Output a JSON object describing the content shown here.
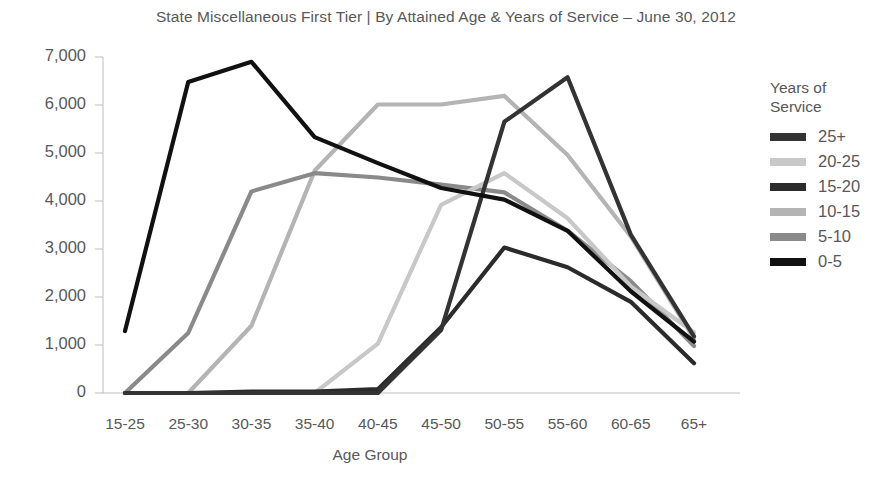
{
  "chart_data": {
    "type": "line",
    "title": "State Miscellaneous First Tier | By Attained Age & Years of Service – June 30, 2012",
    "xlabel": "Age Group",
    "ylabel": "",
    "legend_title": "Years of\nService",
    "legend_position": "right",
    "grid": false,
    "categories": [
      "15-25",
      "25-30",
      "30-35",
      "35-40",
      "40-45",
      "45-50",
      "50-55",
      "55-60",
      "60-65",
      "65+"
    ],
    "ylim": [
      0,
      7000
    ],
    "yticks": [
      0,
      1000,
      2000,
      3000,
      4000,
      5000,
      6000,
      7000
    ],
    "ytick_labels": [
      "0",
      "1,000",
      "2,000",
      "3,000",
      "4,000",
      "5,000",
      "6,000",
      "7,000"
    ],
    "series": [
      {
        "name": "25+",
        "color": "#333333",
        "values": [
          0,
          0,
          0,
          0,
          0,
          1310,
          5650,
          6580,
          3300,
          1180
        ]
      },
      {
        "name": "20-25",
        "color": "#c8c8c8",
        "values": [
          0,
          0,
          0,
          0,
          1030,
          3920,
          4580,
          3640,
          2220,
          1260
        ]
      },
      {
        "name": "15-20",
        "color": "#2b2b2b",
        "values": [
          0,
          0,
          30,
          30,
          80,
          1370,
          3030,
          2620,
          1900,
          620
        ]
      },
      {
        "name": "10-15",
        "color": "#b4b4b4",
        "values": [
          0,
          0,
          1400,
          4630,
          6010,
          6010,
          6190,
          4960,
          3260,
          1130
        ]
      },
      {
        "name": "5-10",
        "color": "#8a8a8a",
        "values": [
          0,
          1250,
          4200,
          4580,
          4490,
          4340,
          4180,
          3380,
          2330,
          980
        ]
      },
      {
        "name": "0-5",
        "color": "#111111",
        "values": [
          1290,
          6480,
          6900,
          5330,
          4790,
          4270,
          4030,
          3380,
          2120,
          1070
        ]
      }
    ]
  },
  "legend": {
    "title": "Years of\nService",
    "items": [
      {
        "label": "25+",
        "color": "#333333"
      },
      {
        "label": "20-25",
        "color": "#c8c8c8"
      },
      {
        "label": "15-20",
        "color": "#2b2b2b"
      },
      {
        "label": "10-15",
        "color": "#b4b4b4"
      },
      {
        "label": "5-10",
        "color": "#8a8a8a"
      },
      {
        "label": "0-5",
        "color": "#111111"
      }
    ]
  },
  "axes": {
    "x_title": "Age Group",
    "axis_color": "#bdbdbd"
  }
}
